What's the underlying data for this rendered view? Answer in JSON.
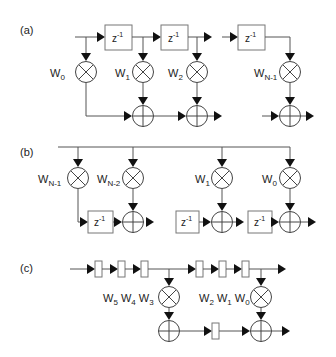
{
  "panels": {
    "a": {
      "label": "(a)",
      "delay": "z",
      "delay_exp": "-1",
      "weights": [
        {
          "base": "W",
          "sub": "0"
        },
        {
          "base": "W",
          "sub": "1"
        },
        {
          "base": "W",
          "sub": "2"
        },
        {
          "base": "W",
          "sub": "N-1"
        }
      ]
    },
    "b": {
      "label": "(b)",
      "delay": "z",
      "delay_exp": "-1",
      "weights": [
        {
          "base": "W",
          "sub": "N-1"
        },
        {
          "base": "W",
          "sub": "N-2"
        },
        {
          "base": "W",
          "sub": "1"
        },
        {
          "base": "W",
          "sub": "0"
        }
      ]
    },
    "c": {
      "label": "(c)",
      "weight_groups": [
        [
          {
            "base": "W",
            "sub": "5"
          },
          {
            "base": "W",
            "sub": "4"
          },
          {
            "base": "W",
            "sub": "3"
          }
        ],
        [
          {
            "base": "W",
            "sub": "2"
          },
          {
            "base": "W",
            "sub": "1"
          },
          {
            "base": "W",
            "sub": "0"
          }
        ]
      ]
    }
  },
  "colors": {
    "line": "#555555",
    "arrow": "#111111",
    "text": "#222222"
  }
}
